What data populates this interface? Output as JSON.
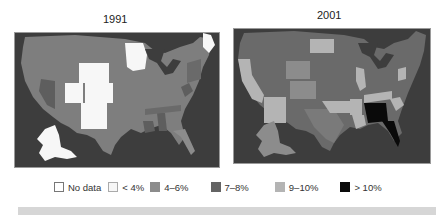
{
  "maps": [
    {
      "title": "1991"
    },
    {
      "title": "2001"
    }
  ],
  "legend": [
    {
      "label": "No data",
      "color": "#ffffff",
      "border": "#777777"
    },
    {
      "label": "< 4%",
      "color": "#f7f7f7",
      "border": "#aaaaaa"
    },
    {
      "label": "4–6%",
      "color": "#8c8c8c",
      "border": "#8c8c8c"
    },
    {
      "label": "7–8%",
      "color": "#646464",
      "border": "#646464"
    },
    {
      "label": "9–10%",
      "color": "#b4b4b4",
      "border": "#b4b4b4"
    },
    {
      "label": "> 10%",
      "color": "#0a0a0a",
      "border": "#0a0a0a"
    }
  ],
  "colors": {
    "background_water": "#3d3d3d",
    "no_data": "#ffffff",
    "lt4": "#f7f7f7",
    "r4_6": "#8c8c8c",
    "r7_8": "#646464",
    "r9_10": "#b4b4b4",
    "gt10": "#0a0a0a"
  }
}
